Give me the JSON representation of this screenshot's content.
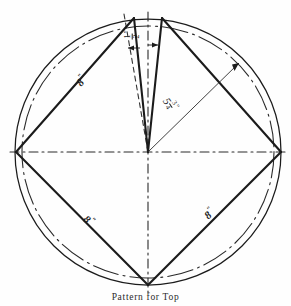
{
  "figure": {
    "caption": "Pattern for Top",
    "title": "Pattern for Top",
    "ink_color": "#1b1b1b",
    "background_color": "#fefefe"
  },
  "labels": {
    "gap_top": {
      "name": "half-inch-dimension",
      "whole": "",
      "numerator": "1",
      "denominator": "2",
      "inch_mark": "\"",
      "text": "1/2\""
    },
    "radius": {
      "name": "radius-dimension",
      "whole": "5",
      "numerator": "3",
      "denominator": "4",
      "inch_mark": "\"",
      "text": "5 3/4\""
    },
    "side_upper_left": {
      "name": "side-dimension-upper-left",
      "value": "8",
      "inch_mark": "\"",
      "text": "8\""
    },
    "side_lower_left": {
      "name": "side-dimension-lower-left",
      "value": "8",
      "inch_mark": "\"",
      "text": "8\""
    },
    "side_lower_right": {
      "name": "side-dimension-lower-right",
      "value": "8",
      "inch_mark": "\"",
      "text": "8\""
    }
  },
  "geometry": {
    "center": {
      "x": 148,
      "y": 152
    },
    "circle_radius": 133,
    "vertices": {
      "left": {
        "x": 16,
        "y": 152
      },
      "right": {
        "x": 281,
        "y": 152
      },
      "bottom": {
        "x": 148,
        "y": 285
      },
      "top_left": {
        "x": 134,
        "y": 18
      },
      "top_right": {
        "x": 162,
        "y": 18
      }
    },
    "notes": "Circle with inscribed square pattern; narrow wedge removed at top between the two top vertices"
  }
}
